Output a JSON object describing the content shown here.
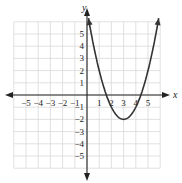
{
  "chart_data": {
    "type": "line",
    "title": "",
    "xlabel": "x",
    "ylabel": "y",
    "xlim": [
      -6,
      6
    ],
    "ylim": [
      -6,
      6
    ],
    "grid": true,
    "x_ticks": [
      -5,
      -4,
      -3,
      -2,
      -1,
      1,
      2,
      3,
      4,
      5
    ],
    "y_ticks": [
      5,
      4,
      3,
      2,
      1,
      -1,
      -2,
      -3,
      -4,
      -5
    ],
    "x_tick_labels": [
      "−5",
      "−4",
      "−3",
      "−2",
      "−1",
      "1",
      "2",
      "3",
      "4",
      "5"
    ],
    "y_tick_labels": [
      "5",
      "4",
      "3",
      "2",
      "1",
      "−1",
      "−2",
      "−3",
      "−4",
      "−5"
    ],
    "series": [
      {
        "name": "parabola",
        "equation": "y = (x − 3)^2 − 2",
        "vertex": [
          3,
          -2
        ],
        "x_intercepts": [
          1.59,
          4.41
        ],
        "x": [
          0.4,
          1,
          1.5,
          2,
          2.5,
          3,
          3.5,
          4,
          4.5,
          5,
          5.6
        ],
        "y": [
          4.76,
          2,
          0.25,
          -1,
          -1.75,
          -2,
          -1.75,
          -1,
          0.25,
          2,
          4.76
        ]
      }
    ],
    "colors": {
      "curve": "#333333",
      "axis": "#222222",
      "grid": "#d9d9d9"
    }
  }
}
